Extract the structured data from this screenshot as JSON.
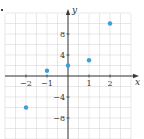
{
  "chart_data": {
    "type": "scatter",
    "title": "",
    "xlabel": "x",
    "ylabel": "y",
    "xlim": [
      -3,
      3
    ],
    "ylim": [
      -12,
      12
    ],
    "grid": true,
    "x_ticks": [
      -2,
      -1,
      1,
      2
    ],
    "x_tick_labels": [
      "−2",
      "−1",
      "1",
      "2"
    ],
    "y_ticks": [
      8,
      4,
      -4,
      -8
    ],
    "y_tick_labels": [
      "8",
      "4",
      "−4",
      "−8"
    ],
    "series": [
      {
        "name": "points",
        "x": [
          -2,
          -1,
          0,
          1,
          2
        ],
        "y": [
          -6,
          1,
          2,
          3,
          10
        ]
      }
    ],
    "colors": {
      "point": "#3a9fd6",
      "axis": "#3a3a3a",
      "grid": "#d9d9d9",
      "text": "#333333"
    }
  }
}
